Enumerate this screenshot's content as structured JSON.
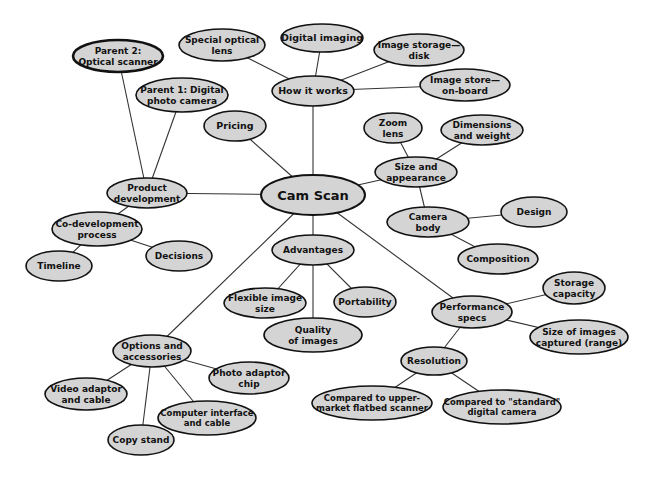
{
  "diagram": {
    "title": "Cam Scan",
    "type": "mind-map",
    "colors": {
      "background": "#ffffff",
      "node_fill": "#d4d4d4",
      "node_stroke": "#111111",
      "edge": "#333333",
      "text": "#111111"
    },
    "nodes": [
      {
        "id": "cam_scan",
        "lines": [
          "Cam Scan"
        ],
        "cx": 313,
        "cy": 195,
        "rx": 52,
        "ry": 20,
        "font": 13,
        "root": true
      },
      {
        "id": "how_it_works",
        "lines": [
          "How it works"
        ],
        "cx": 313,
        "cy": 91,
        "rx": 41,
        "ry": 15,
        "font": 9.5
      },
      {
        "id": "special_optical_lens",
        "lines": [
          "Special optical",
          "lens"
        ],
        "cx": 222,
        "cy": 45,
        "rx": 43,
        "ry": 16,
        "font": 9
      },
      {
        "id": "digital_imaging",
        "lines": [
          "Digital imaging"
        ],
        "cx": 322,
        "cy": 38,
        "rx": 41,
        "ry": 14,
        "font": 9.5
      },
      {
        "id": "image_storage_disk",
        "lines": [
          "Image storage—",
          "disk"
        ],
        "cx": 419,
        "cy": 50,
        "rx": 45,
        "ry": 16,
        "font": 9
      },
      {
        "id": "image_store_onboard",
        "lines": [
          "Image store—",
          "on-board"
        ],
        "cx": 465,
        "cy": 85,
        "rx": 45,
        "ry": 16,
        "font": 9
      },
      {
        "id": "pricing",
        "lines": [
          "Pricing"
        ],
        "cx": 235,
        "cy": 126,
        "rx": 31,
        "ry": 15,
        "font": 9.5
      },
      {
        "id": "product_development",
        "lines": [
          "Product",
          "development"
        ],
        "cx": 147,
        "cy": 193,
        "rx": 40,
        "ry": 15,
        "font": 9
      },
      {
        "id": "parent_2",
        "lines": [
          "Parent 2:",
          "Optical scanner"
        ],
        "cx": 118,
        "cy": 56,
        "rx": 45,
        "ry": 16,
        "font": 9,
        "thick": true
      },
      {
        "id": "parent_1",
        "lines": [
          "Parent 1: Digital",
          "photo camera"
        ],
        "cx": 182,
        "cy": 95,
        "rx": 46,
        "ry": 17,
        "font": 9
      },
      {
        "id": "co_development",
        "lines": [
          "Co-development",
          "process"
        ],
        "cx": 97,
        "cy": 229,
        "rx": 45,
        "ry": 17,
        "font": 9
      },
      {
        "id": "timeline",
        "lines": [
          "Timeline"
        ],
        "cx": 59,
        "cy": 266,
        "rx": 33,
        "ry": 15,
        "font": 9
      },
      {
        "id": "decisions",
        "lines": [
          "Decisions"
        ],
        "cx": 179,
        "cy": 256,
        "rx": 33,
        "ry": 15,
        "font": 9
      },
      {
        "id": "size_and_appearance",
        "lines": [
          "Size and",
          "appearance"
        ],
        "cx": 416,
        "cy": 172,
        "rx": 41,
        "ry": 15,
        "font": 9
      },
      {
        "id": "zoom_lens",
        "lines": [
          "Zoom",
          "lens"
        ],
        "cx": 393,
        "cy": 128,
        "rx": 29,
        "ry": 15,
        "font": 9
      },
      {
        "id": "dimensions_weight",
        "lines": [
          "Dimensions",
          "and weight"
        ],
        "cx": 482,
        "cy": 130,
        "rx": 41,
        "ry": 15,
        "font": 9
      },
      {
        "id": "camera_body",
        "lines": [
          "Camera",
          "body"
        ],
        "cx": 428,
        "cy": 222,
        "rx": 41,
        "ry": 15,
        "font": 9
      },
      {
        "id": "design",
        "lines": [
          "Design"
        ],
        "cx": 534,
        "cy": 212,
        "rx": 33,
        "ry": 15,
        "font": 9
      },
      {
        "id": "composition",
        "lines": [
          "Composition"
        ],
        "cx": 498,
        "cy": 259,
        "rx": 40,
        "ry": 15,
        "font": 9
      },
      {
        "id": "advantages",
        "lines": [
          "Advantages"
        ],
        "cx": 313,
        "cy": 250,
        "rx": 41,
        "ry": 15,
        "font": 9
      },
      {
        "id": "flexible_image_size",
        "lines": [
          "Flexible image",
          "size"
        ],
        "cx": 265,
        "cy": 303,
        "rx": 41,
        "ry": 15,
        "font": 9
      },
      {
        "id": "portability",
        "lines": [
          "Portability"
        ],
        "cx": 365,
        "cy": 302,
        "rx": 31,
        "ry": 15,
        "font": 9
      },
      {
        "id": "quality_of_images",
        "lines": [
          "Quality",
          "of images"
        ],
        "cx": 313,
        "cy": 335,
        "rx": 49,
        "ry": 17,
        "font": 9
      },
      {
        "id": "performance_specs",
        "lines": [
          "Performance",
          "specs"
        ],
        "cx": 472,
        "cy": 312,
        "rx": 40,
        "ry": 16,
        "font": 9
      },
      {
        "id": "storage_capacity",
        "lines": [
          "Storage",
          "capacity"
        ],
        "cx": 574,
        "cy": 288,
        "rx": 31,
        "ry": 16,
        "font": 9
      },
      {
        "id": "size_of_images",
        "lines": [
          "Size of images",
          "captured (range)"
        ],
        "cx": 579,
        "cy": 337,
        "rx": 49,
        "ry": 17,
        "font": 9
      },
      {
        "id": "resolution",
        "lines": [
          "Resolution"
        ],
        "cx": 434,
        "cy": 361,
        "rx": 33,
        "ry": 14,
        "font": 9
      },
      {
        "id": "compared_flatbed",
        "lines": [
          "Compared to upper-",
          "market flatbed scanner"
        ],
        "cx": 372,
        "cy": 403,
        "rx": 60,
        "ry": 17,
        "font": 8.5
      },
      {
        "id": "compared_standard",
        "lines": [
          "Compared to \"standard\"",
          "digital camera"
        ],
        "cx": 502,
        "cy": 407,
        "rx": 59,
        "ry": 17,
        "font": 8.5
      },
      {
        "id": "options_accessories",
        "lines": [
          "Options and",
          "accessories"
        ],
        "cx": 152,
        "cy": 351,
        "rx": 39,
        "ry": 16,
        "font": 9
      },
      {
        "id": "photo_adaptor_chip",
        "lines": [
          "Photo adaptor",
          "chip"
        ],
        "cx": 249,
        "cy": 378,
        "rx": 40,
        "ry": 16,
        "font": 9
      },
      {
        "id": "video_adaptor",
        "lines": [
          "Video adaptor",
          "and cable"
        ],
        "cx": 86,
        "cy": 394,
        "rx": 41,
        "ry": 16,
        "font": 9
      },
      {
        "id": "computer_interface",
        "lines": [
          "Computer interface",
          "and cable"
        ],
        "cx": 207,
        "cy": 418,
        "rx": 49,
        "ry": 17,
        "font": 8.5
      },
      {
        "id": "copy_stand",
        "lines": [
          "Copy stand"
        ],
        "cx": 141,
        "cy": 440,
        "rx": 33,
        "ry": 15,
        "font": 9
      }
    ],
    "edges": [
      [
        "cam_scan",
        "how_it_works"
      ],
      [
        "how_it_works",
        "special_optical_lens"
      ],
      [
        "how_it_works",
        "digital_imaging"
      ],
      [
        "how_it_works",
        "image_storage_disk"
      ],
      [
        "how_it_works",
        "image_store_onboard"
      ],
      [
        "cam_scan",
        "pricing"
      ],
      [
        "cam_scan",
        "product_development"
      ],
      [
        "product_development",
        "parent_2"
      ],
      [
        "product_development",
        "parent_1"
      ],
      [
        "product_development",
        "co_development"
      ],
      [
        "co_development",
        "timeline"
      ],
      [
        "co_development",
        "decisions"
      ],
      [
        "cam_scan",
        "size_and_appearance"
      ],
      [
        "size_and_appearance",
        "zoom_lens"
      ],
      [
        "size_and_appearance",
        "dimensions_weight"
      ],
      [
        "size_and_appearance",
        "camera_body"
      ],
      [
        "camera_body",
        "design"
      ],
      [
        "camera_body",
        "composition"
      ],
      [
        "cam_scan",
        "advantages"
      ],
      [
        "advantages",
        "flexible_image_size"
      ],
      [
        "advantages",
        "portability"
      ],
      [
        "advantages",
        "quality_of_images"
      ],
      [
        "cam_scan",
        "performance_specs"
      ],
      [
        "performance_specs",
        "storage_capacity"
      ],
      [
        "performance_specs",
        "size_of_images"
      ],
      [
        "performance_specs",
        "resolution"
      ],
      [
        "resolution",
        "compared_flatbed"
      ],
      [
        "resolution",
        "compared_standard"
      ],
      [
        "cam_scan",
        "options_accessories"
      ],
      [
        "options_accessories",
        "photo_adaptor_chip"
      ],
      [
        "options_accessories",
        "video_adaptor"
      ],
      [
        "options_accessories",
        "computer_interface"
      ],
      [
        "options_accessories",
        "copy_stand"
      ]
    ]
  }
}
